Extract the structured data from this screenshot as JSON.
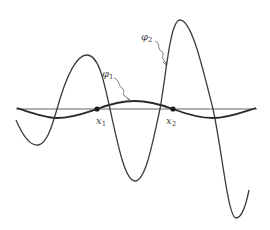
{
  "diagram": {
    "title": "",
    "curves": [
      {
        "id": "phi1",
        "label": "φ",
        "subscript": "1",
        "description": "low-amplitude wave through marked points"
      },
      {
        "id": "phi2",
        "label": "φ",
        "subscript": "2",
        "description": "high-amplitude oscillation of increasing amplitude"
      }
    ],
    "points": [
      {
        "id": "x1",
        "label": "x",
        "subscript": "1"
      },
      {
        "id": "x2",
        "label": "x",
        "subscript": "2"
      }
    ],
    "colors": {
      "background": "#ffffff",
      "stroke": "#3c3c3c",
      "label": "#444444"
    }
  }
}
